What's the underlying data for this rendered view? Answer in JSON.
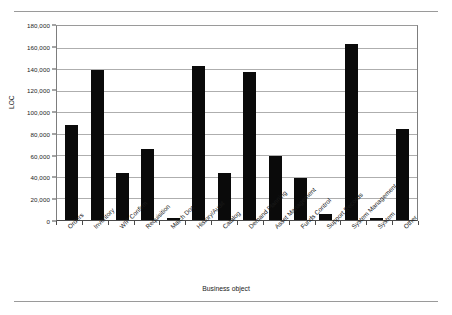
{
  "chart_data": {
    "type": "bar",
    "title": "",
    "xlabel": "Business object",
    "ylabel": "LOC",
    "ylim": [
      0,
      180000
    ],
    "ytick_step": 20000,
    "ytick_labels": [
      "0",
      "20,000",
      "40,000",
      "60,000",
      "80,000",
      "100,000",
      "120,000",
      "140,000",
      "160,000",
      "180,000"
    ],
    "ytick_values": [
      0,
      20000,
      40000,
      60000,
      80000,
      100000,
      120000,
      140000,
      160000,
      180000
    ],
    "grid": true,
    "legend": "none",
    "categories": [
      "Orders",
      "Inventory",
      "WIP Confirm",
      "Requisition",
      "Match Doc",
      "History/Audit",
      "Catalog",
      "Demand Planning",
      "Asset Management",
      "Funds Control",
      "Support Records",
      "System Management",
      "System",
      "Other"
    ],
    "values": [
      88000,
      139500,
      44000,
      66000,
      1500,
      143000,
      43500,
      137000,
      59500,
      39000,
      5500,
      163000,
      1500,
      84500
    ],
    "bar_color": "#0a0a0a"
  },
  "figure": {
    "axis_color": "#4a4a4a",
    "grid_color": "#aeaeae",
    "rule_color": "#9a9a9a"
  }
}
